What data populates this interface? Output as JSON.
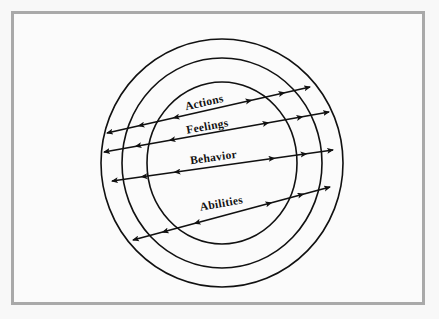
{
  "figure": {
    "name": "concentric-bands-diagram",
    "background_color": "#f8f8f8",
    "frame_color": "#a9a9a9",
    "stroke_color": "#111111"
  },
  "diagram_data": {
    "type": "concentric-rings",
    "center": {
      "x": 222,
      "y": 163
    },
    "rings": [
      {
        "name": "outer-ring",
        "rx": 121,
        "ry": 124
      },
      {
        "name": "middle-ring",
        "rx": 100,
        "ry": 105
      },
      {
        "name": "inner-ring",
        "rx": 75,
        "ry": 81
      }
    ],
    "bands": [
      {
        "label": "Actions",
        "line": {
          "x1": 107,
          "y1": 133,
          "x2": 310,
          "y2": 87
        },
        "label_x": 205,
        "label_y": 106,
        "rotation": -12.8,
        "arrow_direction": "bidirectional"
      },
      {
        "label": "Feelings",
        "line": {
          "x1": 104,
          "y1": 152,
          "x2": 329,
          "y2": 112
        },
        "label_x": 208,
        "label_y": 130,
        "rotation": -10.1,
        "arrow_direction": "bidirectional"
      },
      {
        "label": "Behavior",
        "line": {
          "x1": 112,
          "y1": 181,
          "x2": 333,
          "y2": 150
        },
        "label_x": 214,
        "label_y": 161,
        "rotation": -8.0,
        "arrow_direction": "bidirectional"
      },
      {
        "label": "Abilities",
        "line": {
          "x1": 133,
          "y1": 240,
          "x2": 330,
          "y2": 187
        },
        "label_x": 222,
        "label_y": 207,
        "rotation": -10.0,
        "arrow_direction": "bidirectional"
      }
    ]
  },
  "labels": {
    "actions": "Actions",
    "feelings": "Feelings",
    "behavior": "Behavior",
    "abilities": "Abilities"
  }
}
